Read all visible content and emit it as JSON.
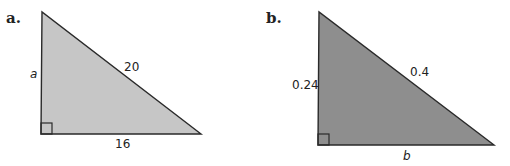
{
  "figures": [
    {
      "part_label": "a.",
      "vertical_leg": "a",
      "hypotenuse": "20",
      "horizontal_leg": "16",
      "fill_color": "#c6c6c6",
      "stroke_color": "#2a2a2a"
    },
    {
      "part_label": "b.",
      "vertical_leg": "0.24",
      "hypotenuse": "0.4",
      "horizontal_leg": "b",
      "fill_color": "#8e8e8e",
      "stroke_color": "#2a2a2a"
    }
  ]
}
